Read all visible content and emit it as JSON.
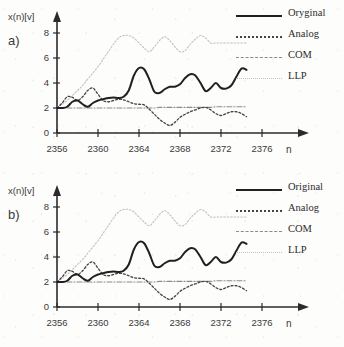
{
  "figure": {
    "background": "#fdfdfc",
    "panels": [
      "a",
      "b"
    ]
  },
  "panel_a": {
    "label": "a)",
    "ylabel": "x(n)[v]",
    "xlabel": "n",
    "legend": [
      {
        "name": "Oryginal",
        "style": "solid",
        "color": "#202020"
      },
      {
        "name": "Analog",
        "style": "dotted",
        "color": "#444444"
      },
      {
        "name": "COM",
        "style": "dashdot",
        "color": "#8a8a8a"
      },
      {
        "name": "LLP",
        "style": "faint",
        "color": "#c2c2c2"
      }
    ]
  },
  "panel_b": {
    "label": "b)",
    "ylabel": "x(n)[v]",
    "xlabel": "n",
    "legend": [
      {
        "name": "Original",
        "style": "solid",
        "color": "#202020"
      },
      {
        "name": "Analog",
        "style": "dotted",
        "color": "#444444"
      },
      {
        "name": "COM",
        "style": "dashdot",
        "color": "#8a8a8a"
      },
      {
        "name": "LLP",
        "style": "faint",
        "color": "#c2c2c2"
      }
    ]
  },
  "chart_data": [
    {
      "type": "line",
      "title": "a)",
      "xlabel": "n",
      "ylabel": "x(n)[v]",
      "xlim": [
        2356,
        2377
      ],
      "ylim": [
        0,
        8.8
      ],
      "xticks": [
        2356,
        2360,
        2364,
        2368,
        2372,
        2376
      ],
      "yticks": [
        0,
        2,
        4,
        6,
        8
      ],
      "grid": false,
      "legend_position": "top-right",
      "x": [
        2356,
        2356.5,
        2357,
        2357.5,
        2358,
        2358.5,
        2359,
        2359.5,
        2360,
        2360.5,
        2361,
        2361.5,
        2362,
        2362.5,
        2363,
        2363.5,
        2364,
        2364.5,
        2365,
        2365.5,
        2366,
        2366.5,
        2367,
        2367.5,
        2368,
        2368.5,
        2369,
        2369.5,
        2370,
        2370.5,
        2371,
        2371.5,
        2372,
        2372.5,
        2373,
        2373.5,
        2374,
        2374.5
      ],
      "series": [
        {
          "name": "Oryginal",
          "style": "solid",
          "color": "#202020",
          "values": [
            2.0,
            2.0,
            2.1,
            2.5,
            2.6,
            2.3,
            2.1,
            2.4,
            2.6,
            2.7,
            2.8,
            2.85,
            2.8,
            2.9,
            3.4,
            4.6,
            5.2,
            5.1,
            4.3,
            3.3,
            3.2,
            3.5,
            3.7,
            3.7,
            3.9,
            4.4,
            4.7,
            4.6,
            4.0,
            3.35,
            3.6,
            4.0,
            3.6,
            3.55,
            3.8,
            4.5,
            5.15,
            5.05
          ]
        },
        {
          "name": "Analog",
          "style": "dotted",
          "color": "#444444",
          "values": [
            2.0,
            2.4,
            2.9,
            2.85,
            2.6,
            2.9,
            3.4,
            3.6,
            3.1,
            2.6,
            2.5,
            2.6,
            2.7,
            2.65,
            2.5,
            2.35,
            2.3,
            2.25,
            1.9,
            1.5,
            1.1,
            0.8,
            0.6,
            0.85,
            1.25,
            1.5,
            1.7,
            1.85,
            2.0,
            2.05,
            1.85,
            1.55,
            1.4,
            1.55,
            1.7,
            1.7,
            1.55,
            1.3
          ]
        },
        {
          "name": "COM",
          "style": "dashdot",
          "color": "#8a8a8a",
          "values": [
            2.0,
            2.0,
            2.0,
            2.0,
            2.0,
            2.0,
            2.0,
            2.0,
            2.0,
            2.0,
            2.0,
            2.0,
            2.0,
            2.0,
            2.0,
            2.0,
            2.0,
            2.0,
            2.0,
            2.0,
            2.05,
            2.05,
            2.05,
            2.05,
            2.05,
            2.05,
            2.05,
            2.05,
            2.05,
            2.05,
            2.05,
            2.1,
            2.1,
            2.1,
            2.1,
            2.1,
            2.1,
            2.1
          ]
        },
        {
          "name": "LLP",
          "style": "faint",
          "color": "#c2c2c2",
          "values": [
            2.0,
            2.3,
            2.6,
            3.0,
            3.4,
            3.8,
            4.3,
            4.8,
            5.3,
            5.9,
            6.5,
            7.1,
            7.6,
            7.8,
            7.8,
            7.6,
            7.2,
            6.8,
            6.5,
            6.9,
            7.4,
            7.7,
            7.4,
            6.9,
            6.5,
            6.6,
            7.1,
            7.5,
            7.8,
            7.6,
            7.2,
            7.2,
            7.2,
            7.2,
            7.2,
            7.2,
            7.2,
            7.2
          ]
        }
      ]
    },
    {
      "type": "line",
      "title": "b)",
      "xlabel": "n",
      "ylabel": "x(n)[v]",
      "xlim": [
        2356,
        2377
      ],
      "ylim": [
        0,
        8.8
      ],
      "xticks": [
        2356,
        2360,
        2364,
        2368,
        2372,
        2376
      ],
      "yticks": [
        0,
        2,
        4,
        6,
        8
      ],
      "grid": false,
      "legend_position": "top-right",
      "x": [
        2356,
        2356.5,
        2357,
        2357.5,
        2358,
        2358.5,
        2359,
        2359.5,
        2360,
        2360.5,
        2361,
        2361.5,
        2362,
        2362.5,
        2363,
        2363.5,
        2364,
        2364.5,
        2365,
        2365.5,
        2366,
        2366.5,
        2367,
        2367.5,
        2368,
        2368.5,
        2369,
        2369.5,
        2370,
        2370.5,
        2371,
        2371.5,
        2372,
        2372.5,
        2373,
        2373.5,
        2374,
        2374.5
      ],
      "series": [
        {
          "name": "Original",
          "style": "solid",
          "color": "#202020",
          "values": [
            2.0,
            2.0,
            2.1,
            2.5,
            2.6,
            2.3,
            2.1,
            2.4,
            2.6,
            2.7,
            2.8,
            2.85,
            2.8,
            2.9,
            3.4,
            4.6,
            5.2,
            5.1,
            4.3,
            3.3,
            3.2,
            3.5,
            3.7,
            3.7,
            3.9,
            4.4,
            4.7,
            4.6,
            4.0,
            3.35,
            3.6,
            4.0,
            3.6,
            3.55,
            3.8,
            4.5,
            5.15,
            5.05
          ]
        },
        {
          "name": "Analog",
          "style": "dotted",
          "color": "#444444",
          "values": [
            2.0,
            2.4,
            2.9,
            2.85,
            2.6,
            2.9,
            3.4,
            3.6,
            3.1,
            2.6,
            2.5,
            2.6,
            2.7,
            2.65,
            2.5,
            2.35,
            2.3,
            2.25,
            1.9,
            1.5,
            1.1,
            0.8,
            0.6,
            0.85,
            1.25,
            1.5,
            1.7,
            1.85,
            2.0,
            2.05,
            1.85,
            1.55,
            1.4,
            1.55,
            1.7,
            1.7,
            1.55,
            1.3
          ]
        },
        {
          "name": "COM",
          "style": "dashdot",
          "color": "#8a8a8a",
          "values": [
            2.0,
            2.0,
            2.0,
            2.0,
            2.0,
            2.0,
            2.0,
            2.0,
            2.0,
            2.0,
            2.0,
            2.0,
            2.0,
            2.0,
            2.0,
            2.0,
            2.0,
            2.0,
            2.0,
            2.0,
            2.05,
            2.05,
            2.05,
            2.05,
            2.05,
            2.05,
            2.05,
            2.05,
            2.05,
            2.05,
            2.05,
            2.1,
            2.1,
            2.1,
            2.1,
            2.1,
            2.1,
            2.1
          ]
        },
        {
          "name": "LLP",
          "style": "faint",
          "color": "#c2c2c2",
          "values": [
            2.0,
            2.3,
            2.6,
            3.0,
            3.4,
            3.8,
            4.3,
            4.8,
            5.3,
            5.9,
            6.5,
            7.1,
            7.6,
            7.8,
            7.8,
            7.6,
            7.2,
            6.8,
            6.5,
            6.9,
            7.4,
            7.7,
            7.4,
            6.9,
            6.5,
            6.6,
            7.1,
            7.5,
            7.8,
            7.6,
            7.2,
            7.2,
            7.2,
            7.2,
            7.2,
            7.2,
            7.2,
            7.2
          ]
        }
      ]
    }
  ]
}
